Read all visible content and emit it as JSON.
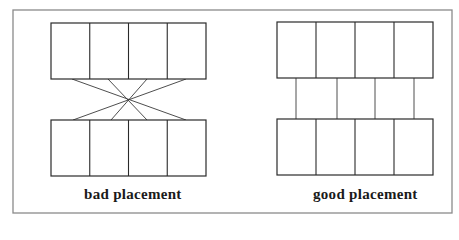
{
  "figure": {
    "frame": {
      "x": 13,
      "y": 10,
      "w": 439,
      "h": 203,
      "color": "#8a8a8a"
    },
    "panels": [
      {
        "id": "bad",
        "label": "bad placement",
        "label_pos": {
          "x": 84,
          "y": 186
        },
        "top_block": {
          "x": 51,
          "y": 23,
          "w": 155,
          "h": 56,
          "cells": 4
        },
        "bottom_block": {
          "x": 51,
          "y": 120,
          "w": 155,
          "h": 56,
          "cells": 4
        },
        "connections": [
          {
            "x1": 72,
            "y1": 79,
            "x2": 186,
            "y2": 120
          },
          {
            "x1": 108,
            "y1": 79,
            "x2": 147,
            "y2": 120
          },
          {
            "x1": 147,
            "y1": 79,
            "x2": 111,
            "y2": 120
          },
          {
            "x1": 186,
            "y1": 79,
            "x2": 73,
            "y2": 120
          }
        ]
      },
      {
        "id": "good",
        "label": "good placement",
        "label_pos": {
          "x": 313,
          "y": 186
        },
        "top_block": {
          "x": 277,
          "y": 22,
          "w": 156,
          "h": 56,
          "cells": 4
        },
        "bottom_block": {
          "x": 277,
          "y": 119,
          "w": 156,
          "h": 56,
          "cells": 4
        },
        "connections": [
          {
            "x1": 296,
            "y1": 78,
            "x2": 296,
            "y2": 119
          },
          {
            "x1": 337,
            "y1": 78,
            "x2": 337,
            "y2": 119
          },
          {
            "x1": 375,
            "y1": 78,
            "x2": 375,
            "y2": 119
          },
          {
            "x1": 414,
            "y1": 78,
            "x2": 414,
            "y2": 119
          }
        ]
      }
    ]
  }
}
